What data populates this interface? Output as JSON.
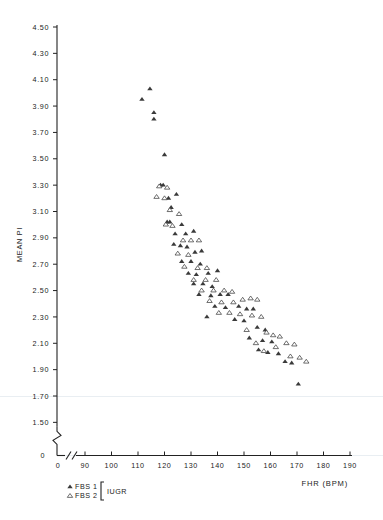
{
  "figure": {
    "ylabel": "MEAN PI",
    "xlabel": "FHR (BPM)",
    "zero_label": "0"
  },
  "legend": {
    "series1_label": "FBS 1",
    "series2_label": "FBS 2",
    "group_label": "IUGR",
    "series1_marker": "filled-triangle-icon",
    "series2_marker": "open-triangle-icon"
  },
  "chart_data": {
    "type": "scatter",
    "title": "",
    "xlabel": "FHR (BPM)",
    "ylabel": "MEAN PI",
    "xlim": [
      85,
      190
    ],
    "ylim": [
      1.6,
      4.5
    ],
    "x_ticks": [
      0,
      90,
      100,
      110,
      120,
      130,
      140,
      150,
      160,
      170,
      180,
      190
    ],
    "y_ticks": [
      0,
      1.5,
      1.7,
      1.9,
      2.1,
      2.3,
      2.5,
      2.7,
      2.9,
      3.1,
      3.3,
      3.5,
      3.7,
      3.9,
      4.1,
      4.3,
      4.5
    ],
    "axis_break_x": true,
    "axis_break_y": true,
    "grid": false,
    "legend_position": "below-left",
    "series": [
      {
        "name": "FBS 1",
        "marker": "filled-triangle",
        "points": [
          [
            114.5,
            4.03
          ],
          [
            111.5,
            3.95
          ],
          [
            116.0,
            3.8
          ],
          [
            116.0,
            3.85
          ],
          [
            120.0,
            3.53
          ],
          [
            118.5,
            3.3
          ],
          [
            119.5,
            3.3
          ],
          [
            121.5,
            3.2
          ],
          [
            124.5,
            3.23
          ],
          [
            122.5,
            3.13
          ],
          [
            121.0,
            3.02
          ],
          [
            122.0,
            3.02
          ],
          [
            126.5,
            3.0
          ],
          [
            124.0,
            2.93
          ],
          [
            128.0,
            2.93
          ],
          [
            131.0,
            2.95
          ],
          [
            123.5,
            2.85
          ],
          [
            126.0,
            2.84
          ],
          [
            128.5,
            2.83
          ],
          [
            131.5,
            2.79
          ],
          [
            134.0,
            2.8
          ],
          [
            126.5,
            2.72
          ],
          [
            130.0,
            2.72
          ],
          [
            133.5,
            2.7
          ],
          [
            129.0,
            2.63
          ],
          [
            132.0,
            2.62
          ],
          [
            136.5,
            2.63
          ],
          [
            140.0,
            2.65
          ],
          [
            131.0,
            2.55
          ],
          [
            134.5,
            2.55
          ],
          [
            138.0,
            2.53
          ],
          [
            133.0,
            2.47
          ],
          [
            137.5,
            2.46
          ],
          [
            141.0,
            2.47
          ],
          [
            144.0,
            2.47
          ],
          [
            139.0,
            2.38
          ],
          [
            143.0,
            2.37
          ],
          [
            136.0,
            2.3
          ],
          [
            148.0,
            2.38
          ],
          [
            151.0,
            2.36
          ],
          [
            153.5,
            2.36
          ],
          [
            146.5,
            2.28
          ],
          [
            150.0,
            2.27
          ],
          [
            155.0,
            2.22
          ],
          [
            158.0,
            2.2
          ],
          [
            152.0,
            2.14
          ],
          [
            157.0,
            2.12
          ],
          [
            160.5,
            2.11
          ],
          [
            155.5,
            2.05
          ],
          [
            159.0,
            2.03
          ],
          [
            163.0,
            2.02
          ],
          [
            165.5,
            1.96
          ],
          [
            168.0,
            1.95
          ],
          [
            170.5,
            1.79
          ]
        ]
      },
      {
        "name": "FBS 2",
        "marker": "open-triangle",
        "points": [
          [
            118.0,
            3.29
          ],
          [
            121.0,
            3.28
          ],
          [
            117.0,
            3.21
          ],
          [
            120.0,
            3.2
          ],
          [
            122.0,
            3.11
          ],
          [
            125.5,
            3.08
          ],
          [
            120.5,
            3.0
          ],
          [
            123.0,
            2.99
          ],
          [
            127.0,
            2.88
          ],
          [
            130.0,
            2.88
          ],
          [
            133.0,
            2.88
          ],
          [
            125.0,
            2.78
          ],
          [
            129.0,
            2.77
          ],
          [
            127.5,
            2.68
          ],
          [
            132.5,
            2.67
          ],
          [
            136.0,
            2.67
          ],
          [
            131.0,
            2.58
          ],
          [
            135.5,
            2.58
          ],
          [
            139.5,
            2.58
          ],
          [
            134.0,
            2.5
          ],
          [
            138.5,
            2.5
          ],
          [
            142.5,
            2.5
          ],
          [
            145.5,
            2.49
          ],
          [
            137.0,
            2.42
          ],
          [
            141.5,
            2.41
          ],
          [
            146.0,
            2.41
          ],
          [
            140.5,
            2.33
          ],
          [
            144.5,
            2.33
          ],
          [
            149.5,
            2.43
          ],
          [
            152.5,
            2.44
          ],
          [
            155.0,
            2.43
          ],
          [
            148.5,
            2.32
          ],
          [
            153.0,
            2.31
          ],
          [
            156.5,
            2.3
          ],
          [
            151.0,
            2.2
          ],
          [
            158.5,
            2.18
          ],
          [
            154.5,
            2.1
          ],
          [
            161.0,
            2.16
          ],
          [
            163.5,
            2.15
          ],
          [
            157.5,
            2.04
          ],
          [
            162.0,
            2.07
          ],
          [
            166.0,
            2.1
          ],
          [
            169.0,
            2.09
          ],
          [
            167.5,
            2.0
          ],
          [
            171.0,
            1.99
          ],
          [
            173.5,
            1.96
          ]
        ]
      }
    ]
  }
}
